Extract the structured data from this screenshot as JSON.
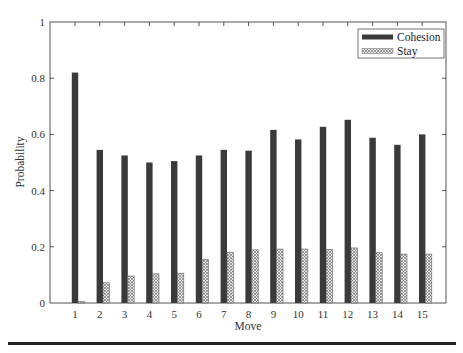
{
  "chart_data": {
    "type": "bar",
    "title": "",
    "xlabel": "Move",
    "ylabel": "Probability",
    "categories": [
      "1",
      "2",
      "3",
      "4",
      "5",
      "6",
      "7",
      "8",
      "9",
      "10",
      "11",
      "12",
      "13",
      "14",
      "15"
    ],
    "series": [
      {
        "name": "Cohesion",
        "color": "#3a3a3a",
        "pattern": "solid",
        "values": [
          0.82,
          0.545,
          0.525,
          0.5,
          0.505,
          0.525,
          0.545,
          0.542,
          0.616,
          0.582,
          0.627,
          0.652,
          0.588,
          0.563,
          0.6
        ]
      },
      {
        "name": "Stay",
        "color": "#bdbdbd",
        "pattern": "crosshatch",
        "values": [
          0.005,
          0.072,
          0.096,
          0.104,
          0.106,
          0.155,
          0.18,
          0.189,
          0.192,
          0.192,
          0.191,
          0.196,
          0.179,
          0.174,
          0.174
        ]
      }
    ],
    "ylim": [
      0,
      1
    ],
    "yticks": [
      "0",
      "0.2",
      "0.4",
      "0.6",
      "0.8",
      "1"
    ],
    "ytick_values": [
      0,
      0.2,
      0.4,
      0.6,
      0.8,
      1
    ],
    "grid": false,
    "legend_position": "upper right"
  },
  "legend": {
    "items": [
      {
        "label": "Cohesion"
      },
      {
        "label": "Stay"
      }
    ]
  },
  "axes": {
    "xlabel": "Move",
    "ylabel": "Probability"
  }
}
